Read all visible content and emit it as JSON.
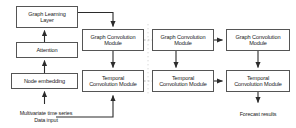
{
  "diagram": {
    "type": "flow-diagram",
    "background_color": "#ffffff",
    "box_border_color": "#555555",
    "arrow_color": "#2b2b2b",
    "dotted_connector_color": "#aaaaaa",
    "text_color": "#1a1a1a",
    "panels": [
      {
        "name": "graph-learning-panel",
        "nodes": [
          {
            "id": "graph-learning-layer",
            "label": "Graph Learning\nLayer",
            "x": 16,
            "y": 6,
            "w": 62,
            "h": 22
          },
          {
            "id": "attention",
            "label": "Attention",
            "x": 16,
            "y": 42,
            "w": 62,
            "h": 16
          },
          {
            "id": "node-embedding",
            "label": "Node embedding",
            "x": 11,
            "y": 73,
            "w": 67,
            "h": 16
          }
        ],
        "labels": [
          {
            "id": "data-input-label",
            "label": "Multivariate time series\nData input",
            "x": 6,
            "y": 104,
            "w": 80
          }
        ]
      },
      {
        "name": "stage-1-panel",
        "nodes": [
          {
            "id": "gcm-1",
            "label": "Graph Convolution\nModule",
            "x": 82,
            "y": 29,
            "w": 62,
            "h": 22
          },
          {
            "id": "tcm-1",
            "label": "Temporal\nConvolution Module",
            "x": 82,
            "y": 70,
            "w": 62,
            "h": 22
          }
        ]
      },
      {
        "name": "stage-2-panel",
        "nodes": [
          {
            "id": "gcm-2",
            "label": "Graph Convolution\nModule",
            "x": 152,
            "y": 29,
            "w": 62,
            "h": 22
          },
          {
            "id": "tcm-2",
            "label": "Temporal\nConvolution Module",
            "x": 152,
            "y": 70,
            "w": 62,
            "h": 22
          }
        ]
      },
      {
        "name": "stage-3-panel",
        "nodes": [
          {
            "id": "gcm-3",
            "label": "Graph Convolution\nModule",
            "x": 226,
            "y": 29,
            "w": 64,
            "h": 22
          },
          {
            "id": "tcm-3",
            "label": "Temporal\nConvolution Module",
            "x": 226,
            "y": 70,
            "w": 64,
            "h": 22
          }
        ],
        "labels": [
          {
            "id": "forecast-results-label",
            "label": "Forecast results",
            "x": 226,
            "y": 105,
            "w": 64
          }
        ]
      }
    ],
    "edges": [
      {
        "id": "edge-node-embedding-to-attention",
        "style": "solid"
      },
      {
        "id": "edge-attention-to-graph-learning-layer",
        "style": "solid"
      },
      {
        "id": "edge-graph-learning-layer-to-gcm-1",
        "style": "solid"
      },
      {
        "id": "edge-data-input-to-node-embedding",
        "style": "solid"
      },
      {
        "id": "edge-data-input-to-tcm-1",
        "style": "solid"
      },
      {
        "id": "edge-gcm-1-to-tcm-1",
        "style": "solid"
      },
      {
        "id": "edge-gcm-1-to-gcm-2",
        "style": "dotted"
      },
      {
        "id": "edge-tcm-1-to-tcm-2",
        "style": "dotted"
      },
      {
        "id": "edge-gcm-2-to-tcm-2",
        "style": "solid"
      },
      {
        "id": "edge-gcm-2-to-gcm-3",
        "style": "solid"
      },
      {
        "id": "edge-tcm-2-to-tcm-3",
        "style": "solid"
      },
      {
        "id": "edge-gcm-3-to-tcm-3",
        "style": "solid"
      },
      {
        "id": "edge-tcm-3-to-forecast-results",
        "style": "solid"
      }
    ],
    "separators": [
      {
        "id": "panel-separator",
        "style": "dotted",
        "x": 148
      }
    ]
  }
}
